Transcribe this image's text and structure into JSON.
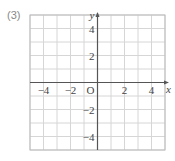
{
  "problem_label": "(3)",
  "axes": {
    "x_label": "x",
    "y_label": "y",
    "origin_label": "O"
  },
  "grid": {
    "x_min": -5,
    "x_max": 5,
    "y_min": -5,
    "y_max": 5,
    "step": 1
  },
  "x_ticks": [
    {
      "value": -4,
      "label": "−4"
    },
    {
      "value": -2,
      "label": "−2"
    },
    {
      "value": 2,
      "label": "2"
    },
    {
      "value": 4,
      "label": "4"
    }
  ],
  "y_ticks": [
    {
      "value": 4,
      "label": "4"
    },
    {
      "value": 2,
      "label": "2"
    },
    {
      "value": -2,
      "label": "−2"
    },
    {
      "value": -4,
      "label": "−4"
    }
  ],
  "colors": {
    "grid": "#d6d6d6",
    "border": "#bbbbbb",
    "axis": "#555555"
  }
}
